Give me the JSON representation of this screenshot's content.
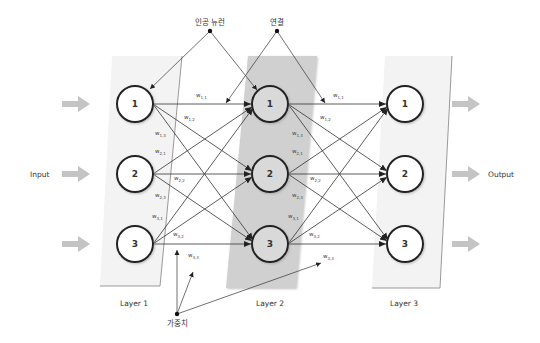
{
  "annotations": {
    "neuron": "인공 뉴런",
    "connection": "연결",
    "weight": "가중치"
  },
  "io": {
    "input": "Input",
    "output": "Output"
  },
  "layers": [
    {
      "label": "Layer 1",
      "nodes": [
        "1",
        "2",
        "3"
      ]
    },
    {
      "label": "Layer 2",
      "nodes": [
        "1",
        "2",
        "3"
      ]
    },
    {
      "label": "Layer 3",
      "nodes": [
        "1",
        "2",
        "3"
      ]
    }
  ],
  "weights_layer1_to_2": {
    "w11": {
      "base": "w",
      "sub": "1,1"
    },
    "w12": {
      "base": "w",
      "sub": "1,2"
    },
    "w13": {
      "base": "w",
      "sub": "1,3"
    },
    "w21": {
      "base": "w",
      "sub": "2,1"
    },
    "w22": {
      "base": "w",
      "sub": "2,2"
    },
    "w23": {
      "base": "w",
      "sub": "2,3"
    },
    "w31": {
      "base": "w",
      "sub": "3,1"
    },
    "w32": {
      "base": "w",
      "sub": "3,2"
    },
    "w33": {
      "base": "w",
      "sub": "3,3"
    }
  },
  "weights_layer2_to_3": {
    "w11": {
      "base": "w",
      "sub": "1,1"
    },
    "w12": {
      "base": "w",
      "sub": "1,2"
    },
    "w13": {
      "base": "w",
      "sub": "1,3"
    },
    "w21": {
      "base": "w",
      "sub": "2,1"
    },
    "w22": {
      "base": "w",
      "sub": "2,2"
    },
    "w23": {
      "base": "w",
      "sub": "2,3"
    },
    "w31": {
      "base": "w",
      "sub": "3,1"
    },
    "w32": {
      "base": "w",
      "sub": "3,2"
    },
    "w33": {
      "base": "w",
      "sub": "3,3"
    }
  },
  "colors": {
    "layer_panel_light": "#f4f4f4",
    "layer_panel_dark": "#cfcfcf",
    "node_stroke": "#222222",
    "arrow_fill": "#c4c4c4",
    "line": "#333333"
  }
}
